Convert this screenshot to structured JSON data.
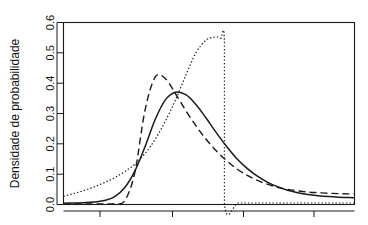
{
  "chart_data": {
    "type": "line",
    "title": "",
    "subtitle": "",
    "xlabel": "",
    "ylabel": "Densidade de probabilidade",
    "xlim": [
      0,
      10
    ],
    "ylim": [
      0.0,
      0.6
    ],
    "grid": false,
    "legend": "none",
    "y_ticks": [
      0.0,
      0.1,
      0.2,
      0.3,
      0.4,
      0.5,
      0.6
    ],
    "y_tick_labels": [
      "0.0",
      "0.1",
      "0.2",
      "0.3",
      "0.4",
      "0.5",
      "0.6"
    ],
    "x_ticks": [
      1.27,
      3.77,
      6.2,
      8.6
    ],
    "x_tick_labels": [
      "",
      "",
      "",
      ""
    ],
    "series": [
      {
        "name": "solid",
        "style": "solid",
        "color": "#1a1a1a",
        "peak_x": 3.85,
        "peak_y": 0.37,
        "x": [
          0.0,
          0.35,
          0.7,
          1.05,
          1.4,
          1.75,
          2.1,
          2.45,
          2.8,
          3.15,
          3.5,
          3.85,
          4.2,
          4.55,
          4.9,
          5.25,
          5.6,
          5.95,
          6.3,
          6.65,
          7.0,
          7.35,
          7.7,
          8.05,
          8.4,
          8.75,
          9.1,
          9.45,
          9.8,
          10.0
        ],
        "y": [
          0.004,
          0.005,
          0.006,
          0.008,
          0.013,
          0.025,
          0.055,
          0.11,
          0.19,
          0.28,
          0.345,
          0.37,
          0.362,
          0.33,
          0.285,
          0.237,
          0.192,
          0.152,
          0.12,
          0.094,
          0.074,
          0.059,
          0.047,
          0.039,
          0.033,
          0.029,
          0.026,
          0.024,
          0.023,
          0.022
        ]
      },
      {
        "name": "dashed",
        "style": "dashed",
        "color": "#1a1a1a",
        "peak_x": 3.15,
        "peak_y": 0.42,
        "x": [
          0.0,
          0.35,
          0.7,
          1.05,
          1.4,
          1.75,
          2.1,
          2.45,
          2.8,
          3.15,
          3.5,
          3.85,
          4.2,
          4.55,
          4.9,
          5.25,
          5.6,
          5.95,
          6.3,
          6.65,
          7.0,
          7.35,
          7.7,
          8.05,
          8.4,
          8.75,
          9.1,
          9.45,
          9.8,
          10.0
        ],
        "y": [
          0.002,
          0.002,
          0.002,
          0.002,
          0.002,
          0.003,
          0.012,
          0.105,
          0.31,
          0.42,
          0.415,
          0.365,
          0.31,
          0.26,
          0.215,
          0.177,
          0.145,
          0.118,
          0.097,
          0.08,
          0.067,
          0.057,
          0.05,
          0.045,
          0.041,
          0.039,
          0.037,
          0.036,
          0.035,
          0.035
        ]
      },
      {
        "name": "dotted",
        "style": "dotted",
        "color": "#1a1a1a",
        "peak_x": 5.4,
        "peak_y": 0.552,
        "truncation_x": 5.53,
        "x": [
          0.0,
          0.35,
          0.7,
          1.05,
          1.4,
          1.75,
          2.1,
          2.45,
          2.8,
          3.15,
          3.5,
          3.85,
          4.2,
          4.55,
          4.9,
          5.2,
          5.4,
          5.53,
          5.53,
          6.0,
          6.5,
          7.0,
          7.5,
          8.0,
          8.5,
          9.0,
          9.5,
          10.0
        ],
        "y": [
          0.027,
          0.036,
          0.046,
          0.058,
          0.072,
          0.088,
          0.108,
          0.133,
          0.168,
          0.215,
          0.275,
          0.345,
          0.425,
          0.5,
          0.542,
          0.552,
          0.548,
          0.53,
          0.005,
          0.005,
          0.005,
          0.005,
          0.005,
          0.005,
          0.005,
          0.005,
          0.005,
          0.005
        ]
      }
    ]
  },
  "axis": {
    "y_title": "Densidade de probabilidade",
    "y_labels": [
      "0.0",
      "0.1",
      "0.2",
      "0.3",
      "0.4",
      "0.5",
      "0.6"
    ]
  }
}
